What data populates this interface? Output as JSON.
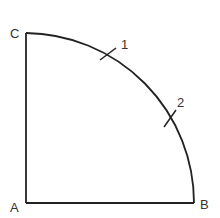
{
  "diagram": {
    "type": "quarter-circle sector construction",
    "stroke_color": "#222222",
    "label_color": "#333333",
    "points": {
      "A": {
        "label": "A",
        "x": 26,
        "y": 203
      },
      "B": {
        "label": "B",
        "x": 194,
        "y": 203
      },
      "C": {
        "label": "C",
        "x": 26,
        "y": 33
      }
    },
    "arc": {
      "from": "B",
      "to": "C",
      "center": "A"
    },
    "ticks": [
      {
        "label": "1",
        "x": 107,
        "y": 54
      },
      {
        "label": "2",
        "x": 170,
        "y": 118
      }
    ]
  }
}
